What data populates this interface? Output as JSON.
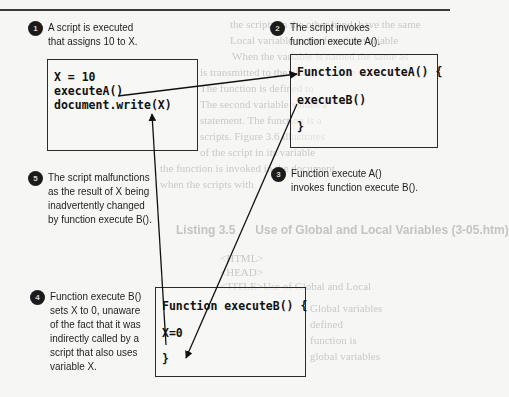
{
  "diagram": {
    "colors": {
      "background": "#f6f6f4",
      "ink": "#1a1a1a",
      "badge": "#1b1b1b",
      "ghost_text": "#c9c9c6"
    },
    "steps": [
      {
        "number": "1",
        "text_lines": [
          "A script is executed",
          "that assigns 10 to X."
        ]
      },
      {
        "number": "2",
        "text_lines": [
          "The script invokes",
          "function execute A()."
        ]
      },
      {
        "number": "3",
        "text_lines": [
          "Function execute A()",
          "invokes function execute B()."
        ]
      },
      {
        "number": "4",
        "text_lines": [
          "Function execute B()",
          "sets X to 0, unaware",
          "of the fact that it was",
          "indirectly called by a",
          "script that also uses",
          "variable X."
        ]
      },
      {
        "number": "5",
        "text_lines": [
          "The script malfunctions",
          "as the result of X being",
          "inadvertently changed",
          "by function execute B()."
        ]
      }
    ],
    "code_boxes": {
      "main_script": {
        "lines": [
          "X = 10",
          "executeA()",
          "document.write(X)"
        ]
      },
      "function_a": {
        "lines": [
          "Function executeA() {",
          "executeB()",
          "}"
        ]
      },
      "function_b": {
        "lines": [
          "Function executeB() {",
          "X=0",
          "}"
        ]
      }
    },
    "arrows": [
      {
        "from": "executeA() call",
        "to": "Function executeA()"
      },
      {
        "from": "executeB() call",
        "to": "X=0 in executeB"
      },
      {
        "from": "X=0 in executeB",
        "to": "document.write(X)"
      }
    ],
    "background_bleed": {
      "listing_label": "Listing 3.5",
      "listing_title": "Use of Global and Local Variables (3-05.htm)"
    }
  }
}
